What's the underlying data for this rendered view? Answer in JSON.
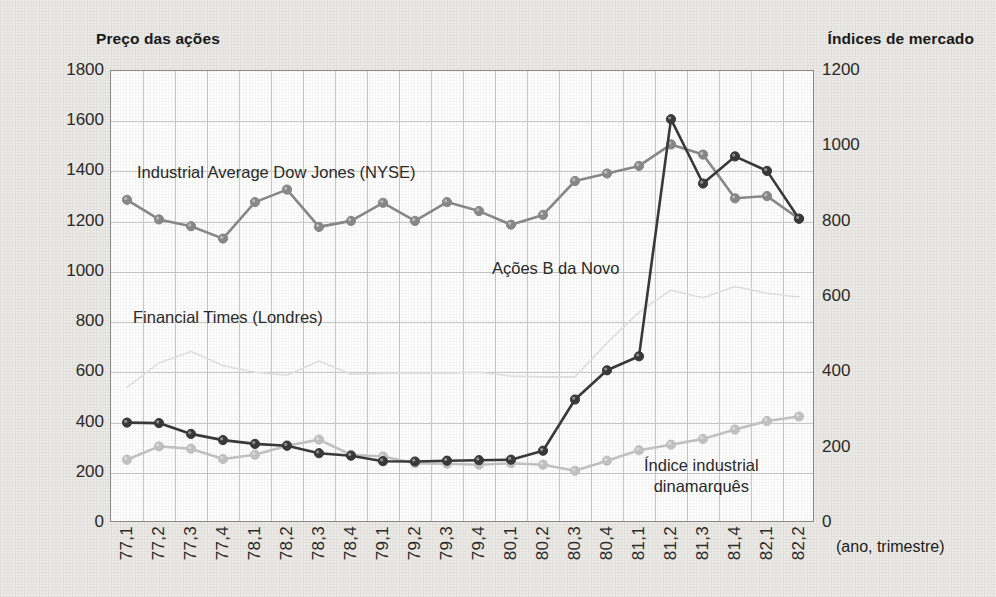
{
  "axis_titles": {
    "left": "Preço das ações",
    "right": "Índices de mercado",
    "bottom": "(ano, trimestre)"
  },
  "annotations": {
    "dow": "Industrial Average Dow Jones (NYSE)",
    "ft": "Financial Times (Londres)",
    "novo": "Ações B da Novo",
    "danish_line1": "Índice industrial",
    "danish_line2": "dinamarquês"
  },
  "colors": {
    "novo": "#3a3a3a",
    "dow": "#8a8a8a",
    "ft": "#e2e2e2",
    "danish": "#c4c4c4",
    "grid": "#c9c9c9",
    "frame": "#8d8d8d",
    "plot_bg": "#ffffff",
    "page_bg": "#eceae6",
    "text": "#1d1d1d"
  },
  "chart_data": {
    "type": "line",
    "title": "",
    "xlabel": "(ano, trimestre)",
    "ylabel": "Preço das ações",
    "y2label": "Índices de mercado",
    "grid": true,
    "legend": "inline-annotations",
    "ylim": [
      0,
      1800
    ],
    "y2lim": [
      0,
      1200
    ],
    "yticks": [
      0,
      200,
      400,
      600,
      800,
      1000,
      1200,
      1400,
      1600,
      1800
    ],
    "y2ticks": [
      0,
      200,
      400,
      600,
      800,
      1000,
      1200
    ],
    "categories": [
      "77,1",
      "77,2",
      "77,3",
      "77,4",
      "78,1",
      "78,2",
      "78,3",
      "78,4",
      "79,1",
      "79,2",
      "79,3",
      "79,4",
      "80,1",
      "80,2",
      "80,3",
      "80,4",
      "81,1",
      "81,2",
      "81,3",
      "81,4",
      "82,1",
      "82,2"
    ],
    "series": [
      {
        "name": "Ações B da Novo",
        "axis": "left",
        "color": "#3a3a3a",
        "values": [
          400,
          398,
          355,
          330,
          315,
          308,
          278,
          268,
          246,
          245,
          248,
          250,
          252,
          288,
          492,
          608,
          664,
          1608,
          1352,
          1460,
          1402,
          1212
        ]
      },
      {
        "name": "Industrial Average Dow Jones (NYSE)",
        "axis": "right",
        "color": "#8a8a8a",
        "values": [
          858,
          806,
          788,
          755,
          852,
          885,
          786,
          802,
          850,
          802,
          852,
          828,
          792,
          818,
          908,
          928,
          948,
          1005,
          978,
          862,
          868,
          808
        ]
      },
      {
        "name": "Financial Times (Londres)",
        "axis": "right",
        "color": "#e2e2e2",
        "values": [
          360,
          425,
          455,
          418,
          400,
          392,
          430,
          395,
          398,
          398,
          398,
          400,
          390,
          388,
          388,
          478,
          560,
          618,
          598,
          628,
          610,
          600
        ]
      },
      {
        "name": "Índice industrial dinamarquês",
        "axis": "left",
        "color": "#c4c4c4",
        "values": [
          252,
          305,
          296,
          255,
          272,
          308,
          332,
          272,
          265,
          238,
          236,
          232,
          238,
          232,
          208,
          248,
          290,
          312,
          335,
          372,
          406,
          424
        ]
      }
    ]
  }
}
